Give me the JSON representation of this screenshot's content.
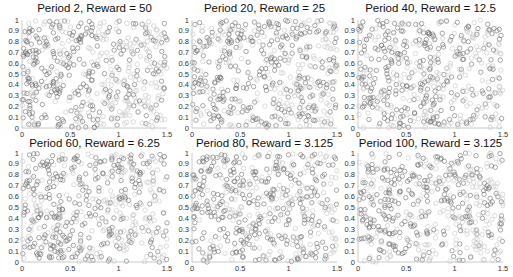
{
  "chart_data": [
    {
      "type": "scatter",
      "title": "Period 2, Reward = 50",
      "xlabel": "",
      "ylabel": "",
      "xlim": [
        0,
        1.5
      ],
      "ylim": [
        0,
        1
      ],
      "xticks": [
        "0",
        "0.5",
        "1",
        "1.5"
      ],
      "yticks": [
        "0",
        "0.1",
        "0.2",
        "0.3",
        "0.4",
        "0.5",
        "0.6",
        "0.7",
        "0.8",
        "0.9",
        "1"
      ],
      "grid": false,
      "marker": "open-circle",
      "point_count_approx": 500,
      "distribution": "approximately uniform random over [0,1.5]x[0,1]; mix of dark and faded gray circles (faded ones more common at the right)",
      "seed": 11
    },
    {
      "type": "scatter",
      "title": "Period 20, Reward = 25",
      "xlim": [
        0,
        1.5
      ],
      "ylim": [
        0,
        1
      ],
      "xticks": [
        "0",
        "0.5",
        "1",
        "1.5"
      ],
      "yticks": [
        "0",
        "0.1",
        "0.2",
        "0.3",
        "0.4",
        "0.5",
        "0.6",
        "0.7",
        "0.8",
        "0.9",
        "1"
      ],
      "grid": false,
      "marker": "open-circle",
      "point_count_approx": 500,
      "distribution": "approximately uniform random",
      "seed": 23
    },
    {
      "type": "scatter",
      "title": "Period 40, Reward = 12.5",
      "xlim": [
        0,
        1.5
      ],
      "ylim": [
        0,
        1
      ],
      "xticks": [
        "0",
        "0.5",
        "1",
        "1.5"
      ],
      "yticks": [
        "0",
        "0.1",
        "0.2",
        "0.3",
        "0.4",
        "0.5",
        "0.6",
        "0.7",
        "0.8",
        "0.9",
        "1"
      ],
      "grid": false,
      "marker": "open-circle",
      "point_count_approx": 500,
      "distribution": "approximately uniform random",
      "seed": 37
    },
    {
      "type": "scatter",
      "title": "Period 60, Reward = 6.25",
      "xlim": [
        0,
        1.5
      ],
      "ylim": [
        0,
        1
      ],
      "xticks": [
        "0",
        "0.5",
        "1",
        "1.5"
      ],
      "yticks": [
        "0",
        "0.1",
        "0.2",
        "0.3",
        "0.4",
        "0.5",
        "0.6",
        "0.7",
        "0.8",
        "0.9",
        "1"
      ],
      "grid": false,
      "marker": "open-circle",
      "point_count_approx": 500,
      "distribution": "approximately uniform random",
      "seed": 41
    },
    {
      "type": "scatter",
      "title": "Period 80, Reward = 3.125",
      "xlim": [
        0,
        1.5
      ],
      "ylim": [
        0,
        1
      ],
      "xticks": [
        "0",
        "0.5",
        "1",
        "1.5"
      ],
      "yticks": [
        "0",
        "0.1",
        "0.2",
        "0.3",
        "0.4",
        "0.5",
        "0.6",
        "0.7",
        "0.8",
        "0.9",
        "1"
      ],
      "grid": false,
      "marker": "open-circle",
      "point_count_approx": 500,
      "distribution": "approximately uniform random",
      "seed": 53
    },
    {
      "type": "scatter",
      "title": "Period 100, Reward = 3.125",
      "xlim": [
        0,
        1.5
      ],
      "ylim": [
        0,
        1
      ],
      "xticks": [
        "0",
        "0.5",
        "1",
        "1.5"
      ],
      "yticks": [
        "0",
        "0.1",
        "0.2",
        "0.3",
        "0.4",
        "0.5",
        "0.6",
        "0.7",
        "0.8",
        "0.9",
        "1"
      ],
      "grid": false,
      "marker": "open-circle",
      "point_count_approx": 500,
      "distribution": "approximately uniform random",
      "seed": 67
    }
  ],
  "style": {
    "marker_dark": "#6e6e6e",
    "marker_light": "#c4c4c4",
    "axis_color": "#bdbdbd"
  },
  "layout": {
    "panels": [
      {
        "x0": 22,
        "y0": 20,
        "w": 145,
        "h": 108,
        "title_y": 2
      },
      {
        "x0": 192,
        "y0": 20,
        "w": 145,
        "h": 108,
        "title_y": 2
      },
      {
        "x0": 358,
        "y0": 20,
        "w": 145,
        "h": 108,
        "title_y": 2
      },
      {
        "x0": 22,
        "y0": 153,
        "w": 145,
        "h": 109,
        "title_y": 137
      },
      {
        "x0": 192,
        "y0": 153,
        "w": 145,
        "h": 109,
        "title_y": 137
      },
      {
        "x0": 358,
        "y0": 153,
        "w": 145,
        "h": 109,
        "title_y": 137
      }
    ]
  }
}
